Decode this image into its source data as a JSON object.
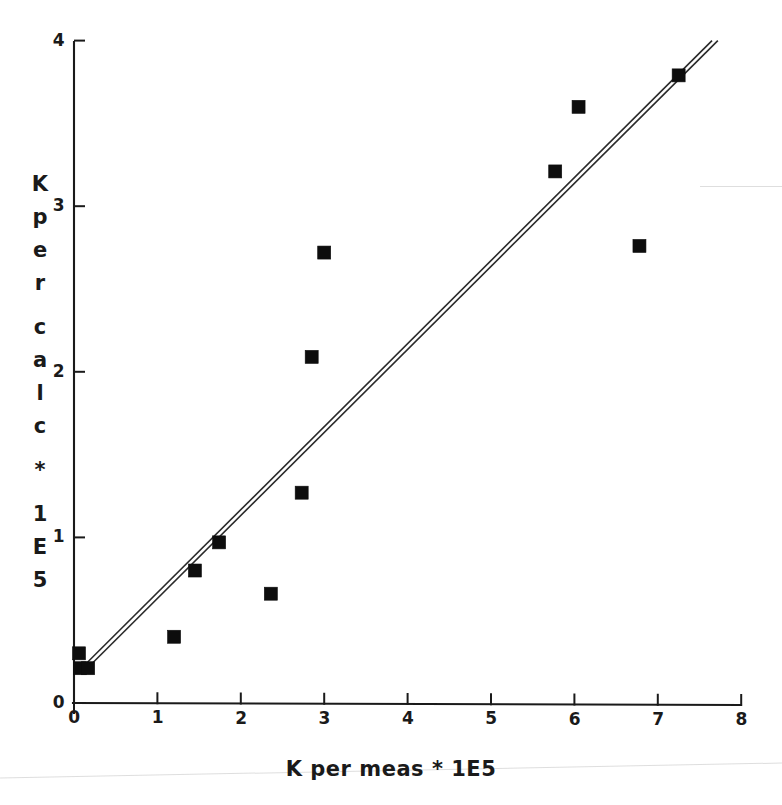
{
  "chart_data": {
    "type": "scatter",
    "title": "",
    "subtitle": "",
    "xlabel": "K per meas * 1E5",
    "ylabel": "K per calc * 1E5",
    "ylabel_chars": [
      "K",
      "p",
      "e",
      "r",
      "c",
      "a",
      "l",
      "c",
      "*",
      "1",
      "E",
      "5"
    ],
    "xlim": [
      0,
      8
    ],
    "ylim": [
      0,
      4
    ],
    "xticks": [
      0,
      1,
      2,
      3,
      4,
      5,
      6,
      7,
      8
    ],
    "yticks": [
      0,
      1,
      2,
      3,
      4
    ],
    "xtick_labels": [
      "0",
      "1",
      "2",
      "3",
      "4",
      "5",
      "6",
      "7",
      "8"
    ],
    "ytick_labels": [
      "0",
      "1",
      "2",
      "3",
      "4"
    ],
    "grid": false,
    "legend": "none",
    "marker_style": "filled-square",
    "marker_color": "#0d0d0d",
    "series": [
      {
        "name": "K per calc vs K per meas",
        "points": [
          {
            "x": 0.06,
            "y": 0.3
          },
          {
            "x": 0.07,
            "y": 0.21
          },
          {
            "x": 0.17,
            "y": 0.21
          },
          {
            "x": 1.2,
            "y": 0.4
          },
          {
            "x": 1.45,
            "y": 0.8
          },
          {
            "x": 1.74,
            "y": 0.97
          },
          {
            "x": 2.36,
            "y": 0.66
          },
          {
            "x": 2.73,
            "y": 1.27
          },
          {
            "x": 2.85,
            "y": 2.09
          },
          {
            "x": 3.0,
            "y": 2.72
          },
          {
            "x": 5.77,
            "y": 3.21
          },
          {
            "x": 6.05,
            "y": 3.6
          },
          {
            "x": 6.78,
            "y": 2.76
          },
          {
            "x": 7.25,
            "y": 3.79
          }
        ]
      }
    ],
    "reference_lines": [
      {
        "name": "identity-line-upper",
        "x0": 0.05,
        "y0": 0.19,
        "x1": 7.65,
        "y1": 4.0,
        "color": "#2a2a2a"
      },
      {
        "name": "identity-line-lower",
        "x0": 0.12,
        "y0": 0.19,
        "x1": 7.72,
        "y1": 4.0,
        "color": "#2a2a2a"
      }
    ]
  }
}
